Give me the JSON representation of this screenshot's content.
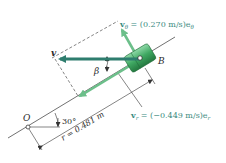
{
  "diagram": {
    "type": "kinematics-polar-velocity",
    "point_origin": "O",
    "point_body": "B",
    "angle_label": "30°",
    "beta_label": "β",
    "v_label": "v",
    "radius_label": "r = 0.481 m",
    "v_theta": {
      "symbol": "v",
      "subscript": "θ",
      "value": " = (0.270 m/s)e",
      "unit_sub": "θ"
    },
    "v_r": {
      "symbol": "v",
      "subscript": "r",
      "value": " = (−0.449 m/s)e",
      "unit_sub": "r"
    },
    "colors": {
      "line": "#333333",
      "velocity_dark": "#2e7d6e",
      "velocity_light": "#6cbf8a",
      "collar_dark": "#2f8a4e",
      "collar_light": "#7fd09a",
      "text_label": "#3a8a80"
    }
  }
}
